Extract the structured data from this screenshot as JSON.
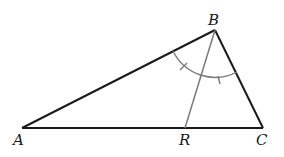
{
  "diagram": {
    "type": "triangle-angle-bisector",
    "points": {
      "A": {
        "label": "A",
        "x": 22,
        "y": 128
      },
      "B": {
        "label": "B",
        "x": 215,
        "y": 30
      },
      "C": {
        "label": "C",
        "x": 263,
        "y": 128
      },
      "R": {
        "label": "R",
        "x": 185,
        "y": 128
      }
    },
    "segments": [
      {
        "from": "A",
        "to": "B",
        "color": "#1a1a1a"
      },
      {
        "from": "B",
        "to": "C",
        "color": "#1a1a1a"
      },
      {
        "from": "A",
        "to": "C",
        "color": "#1a1a1a"
      },
      {
        "from": "B",
        "to": "R",
        "color": "#7a7a7a"
      }
    ],
    "angle_marks": {
      "vertex": "B",
      "description": "angle ABC bisected by BR; two equal angles marked with single tick each",
      "arc_color": "#7a7a7a"
    },
    "labels": {
      "A": "A",
      "B": "B",
      "C": "C",
      "R": "R"
    }
  }
}
